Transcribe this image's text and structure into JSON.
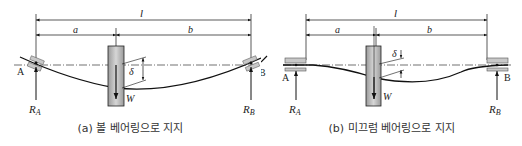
{
  "panels": [
    {
      "id": "a",
      "caption": "(a) 볼 베어링으로 지지",
      "support_type": "ball bearing",
      "labels": {
        "total_length": "l",
        "left_span": "a",
        "right_span": "b",
        "deflection": "δ",
        "load": "W",
        "support_left": "A",
        "support_right": "B",
        "reaction_left": "R",
        "reaction_left_sub": "A",
        "reaction_right": "R",
        "reaction_right_sub": "B"
      }
    },
    {
      "id": "b",
      "caption": "(b) 미끄럼 베어링으로 지지",
      "support_type": "sliding bearing",
      "labels": {
        "total_length": "l",
        "left_span": "a",
        "right_span": "b",
        "deflection": "δ",
        "load": "W",
        "support_left": "A",
        "support_right": "B",
        "reaction_left": "R",
        "reaction_left_sub": "A",
        "reaction_right": "R",
        "reaction_right_sub": "B"
      }
    }
  ],
  "colors": {
    "line": "#111111",
    "disk_fill": "#b5b5b5",
    "bearing_fill": "#c8c8c8"
  }
}
